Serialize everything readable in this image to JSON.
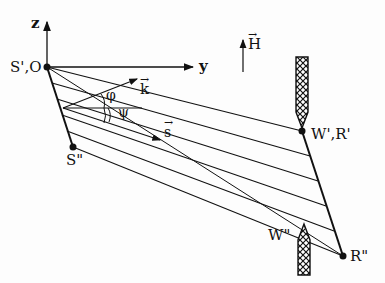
{
  "diagram": {
    "labels": {
      "z_axis": "z",
      "y_axis": "y",
      "origin": "S',O",
      "k_vector": "k",
      "s_vector": "s",
      "h_field": "H",
      "phi": "φ",
      "psi": "ψ",
      "s_double_prime": "S\"",
      "w_r_prime": "W',R'",
      "w_double_prime": "W\"",
      "r_double_prime": "R\""
    },
    "vector_arrow": "→",
    "colors": {
      "ink": "#111111",
      "background": "#fdfdfd"
    }
  }
}
